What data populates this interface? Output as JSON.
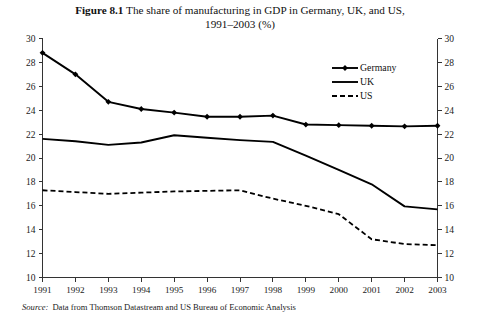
{
  "title": {
    "figure_number": "Figure 8.1",
    "text": "The share of manufacturing in GDP in Germany, UK, and US,",
    "line2": "1991–2003 (%)"
  },
  "source": {
    "label": "Source:",
    "text": "Data from Thomson Datastream and US Bureau of Economic Analysis"
  },
  "legend": {
    "position": "top-right",
    "items": [
      {
        "label": "Germany",
        "style": "solid-marker",
        "marker": "diamond",
        "color": "#000000"
      },
      {
        "label": "UK",
        "style": "solid",
        "marker": "none",
        "color": "#000000"
      },
      {
        "label": "US",
        "style": "dashed",
        "marker": "none",
        "color": "#000000"
      }
    ]
  },
  "chart_data": {
    "type": "line",
    "title": "Figure 8.1 The share of manufacturing in GDP in Germany, UK, and US, 1991–2003 (%)",
    "xlabel": "",
    "ylabel": "",
    "x": [
      1991,
      1992,
      1993,
      1994,
      1995,
      1996,
      1997,
      1998,
      1999,
      2000,
      2001,
      2002,
      2003
    ],
    "categories": [
      "1991",
      "1992",
      "1993",
      "1994",
      "1995",
      "1996",
      "1997",
      "1998",
      "1999",
      "2000",
      "2001",
      "2002",
      "2003"
    ],
    "series": [
      {
        "name": "Germany",
        "values": [
          28.8,
          27.0,
          24.7,
          24.1,
          23.8,
          23.45,
          23.45,
          23.55,
          22.8,
          22.75,
          22.7,
          22.65,
          22.7
        ]
      },
      {
        "name": "UK",
        "values": [
          21.6,
          21.4,
          21.1,
          21.3,
          21.9,
          21.7,
          21.5,
          21.35,
          20.2,
          19.0,
          17.8,
          15.95,
          15.7
        ]
      },
      {
        "name": "US",
        "values": [
          17.3,
          17.15,
          17.0,
          17.1,
          17.2,
          17.25,
          17.3,
          16.6,
          16.0,
          15.3,
          13.2,
          12.8,
          12.7
        ]
      }
    ],
    "ylim": [
      10,
      30
    ],
    "yticks": [
      10,
      12,
      14,
      16,
      18,
      20,
      22,
      24,
      26,
      28,
      30
    ],
    "xlim": [
      1991,
      2003
    ],
    "grid": false,
    "right_axis": true,
    "right_yticks": [
      10,
      12,
      14,
      16,
      18,
      20,
      22,
      24,
      26,
      28,
      30
    ]
  },
  "axes": {
    "left_tick_labels": [
      "30",
      "28",
      "26",
      "24",
      "22",
      "20",
      "18",
      "16",
      "14",
      "12",
      "10"
    ],
    "right_tick_labels": [
      "30",
      "28",
      "26",
      "24",
      "22",
      "20",
      "18",
      "16",
      "14",
      "12",
      "10"
    ],
    "x_tick_labels": [
      "1991",
      "1992",
      "1993",
      "1994",
      "1995",
      "1996",
      "1997",
      "1998",
      "1999",
      "2000",
      "2001",
      "2002",
      "2003"
    ]
  }
}
